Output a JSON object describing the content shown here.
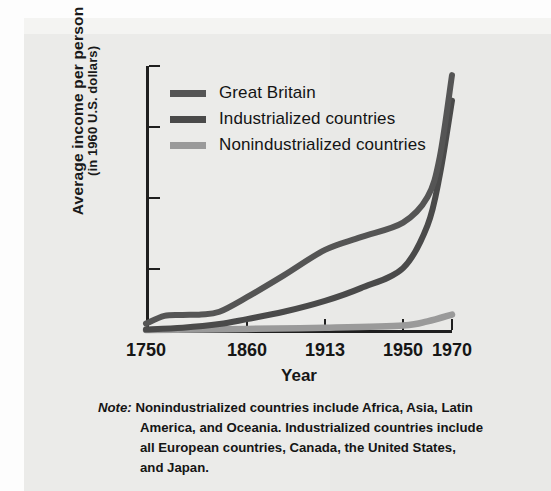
{
  "figure": {
    "background_color": "#ebebe9",
    "ink_color": "#161616"
  },
  "axes": {
    "y_title_line1": "Average income per person",
    "y_title_line2": "(in 1960 U.S. dollars)",
    "x_title": "Year"
  },
  "legend": {
    "items": [
      {
        "label": "Great Britain",
        "color": "#555555"
      },
      {
        "label": "Industrialized countries",
        "color": "#4a4a4a"
      },
      {
        "label": "Nonindustrialized countries",
        "color": "#9a9a9a"
      }
    ]
  },
  "note": {
    "lead": "Note:",
    "line1": "Nonindustrialized countries include Africa, Asia, Latin",
    "line2": "America, and Oceania. Industrialized countries include",
    "line3": "all European countries, Canada, the United States,",
    "line4": "and Japan."
  },
  "chart_data": {
    "type": "line",
    "title": "",
    "xlabel": "Year",
    "ylabel": "Average income per person (in 1960 U.S. dollars)",
    "x_tick_labels": [
      "1750",
      "1860",
      "1913",
      "1950",
      "1970"
    ],
    "x_tick_positions": [
      0,
      0.33,
      0.585,
      0.84,
      1.0
    ],
    "y_tick_labels": [
      "100",
      "775",
      "1550",
      "2325",
      "3000"
    ],
    "y_tick_values": [
      100,
      775,
      1550,
      2325,
      3000
    ],
    "ylim": [
      100,
      3000
    ],
    "grid": false,
    "legend_position": "upper-left-inside",
    "series": [
      {
        "name": "Great Britain",
        "color": "#555555",
        "points": [
          {
            "x": 1750,
            "y": 170
          },
          {
            "x": 1770,
            "y": 255
          },
          {
            "x": 1790,
            "y": 265
          },
          {
            "x": 1810,
            "y": 270
          },
          {
            "x": 1830,
            "y": 300
          },
          {
            "x": 1860,
            "y": 460
          },
          {
            "x": 1885,
            "y": 700
          },
          {
            "x": 1913,
            "y": 980
          },
          {
            "x": 1930,
            "y": 1120
          },
          {
            "x": 1950,
            "y": 1280
          },
          {
            "x": 1960,
            "y": 1560
          },
          {
            "x": 1965,
            "y": 2000
          },
          {
            "x": 1970,
            "y": 2900
          }
        ]
      },
      {
        "name": "Industrialized countries",
        "color": "#4a4a4a",
        "points": [
          {
            "x": 1750,
            "y": 105
          },
          {
            "x": 1790,
            "y": 125
          },
          {
            "x": 1830,
            "y": 165
          },
          {
            "x": 1860,
            "y": 220
          },
          {
            "x": 1885,
            "y": 300
          },
          {
            "x": 1913,
            "y": 420
          },
          {
            "x": 1930,
            "y": 560
          },
          {
            "x": 1950,
            "y": 780
          },
          {
            "x": 1960,
            "y": 1250
          },
          {
            "x": 1965,
            "y": 1800
          },
          {
            "x": 1970,
            "y": 2620
          }
        ]
      },
      {
        "name": "Nonindustrialized countries",
        "color": "#9a9a9a",
        "points": [
          {
            "x": 1750,
            "y": 100
          },
          {
            "x": 1860,
            "y": 112
          },
          {
            "x": 1913,
            "y": 125
          },
          {
            "x": 1950,
            "y": 150
          },
          {
            "x": 1960,
            "y": 195
          },
          {
            "x": 1970,
            "y": 270
          }
        ]
      }
    ]
  }
}
